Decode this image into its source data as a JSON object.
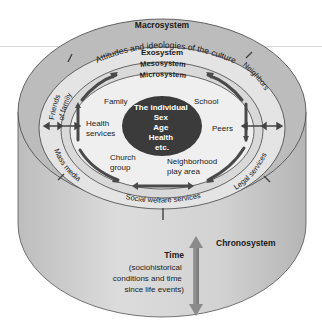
{
  "diagram": {
    "systems": {
      "macrosystem": {
        "label": "Macrosystem",
        "description": "Attitudes and ideologies of the culture"
      },
      "exosystem": {
        "label": "Exosystem",
        "items": [
          "Friends of family",
          "Neighbors",
          "Mass media",
          "Legal services",
          "Social welfare services"
        ]
      },
      "mesosystem": {
        "label": "Mesosystem"
      },
      "microsystem": {
        "label": "Microsystem",
        "items": [
          "Family",
          "School",
          "Health services",
          "Peers",
          "Church group",
          "Neighborhood play area"
        ]
      },
      "individual": {
        "lines": [
          "The individual",
          "Sex",
          "Age",
          "Health",
          "etc."
        ]
      },
      "chronosystem": {
        "label": "Chronosystem",
        "time_label": "Time",
        "time_description": [
          "(sociohistorical",
          "conditions and time",
          "since life events)"
        ]
      }
    },
    "exo_items": {
      "friends": [
        "Friends",
        "of family"
      ],
      "neighbors": "Neighbors",
      "mass_media": "Mass media",
      "legal": "Legal services",
      "welfare": "Social welfare services"
    },
    "micro_items": {
      "family": "Family",
      "school": "School",
      "health": [
        "Health",
        "services"
      ],
      "peers": "Peers",
      "church": [
        "Church",
        "group"
      ],
      "neighborhood": [
        "Neighborhood",
        "play area"
      ]
    },
    "colors": {
      "macro_ring": "#b9b9b9",
      "exo_ring": "#e3e3e3",
      "meso_ring": "#d6d6d6",
      "micro_fill": "#ededed",
      "individual": "#3a3a3a",
      "cylinder_side": "#cfcfcf",
      "arrow": "#555555",
      "time_arrow": "#8a8a8a"
    }
  }
}
